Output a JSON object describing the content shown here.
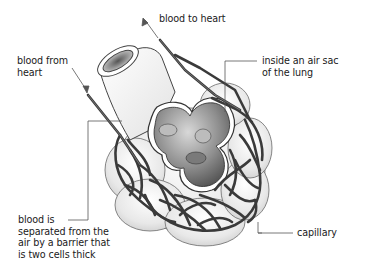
{
  "diagram": {
    "colors": {
      "background": "#ffffff",
      "vessel": "#3a3a3a",
      "alveolus_fill": "#f2f2f2",
      "alveolus_interior": "#8a8a8a",
      "leader_line": "#555555",
      "text": "#1a1a1a"
    },
    "labels": {
      "blood_to_heart": {
        "lines": [
          "blood to heart"
        ]
      },
      "blood_from_heart": {
        "lines": [
          "blood from",
          "heart"
        ]
      },
      "inside_air_sac": {
        "lines": [
          "inside an air sac",
          "of the lung"
        ]
      },
      "barrier": {
        "lines": [
          "blood is",
          "separated from the",
          "air by a barrier that",
          "is two cells thick"
        ]
      },
      "capillary": {
        "lines": [
          "capillary"
        ]
      }
    }
  }
}
